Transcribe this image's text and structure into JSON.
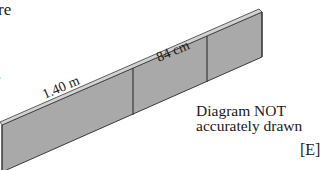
{
  "question_fragment": {
    "cropped_text_top": "re",
    "cropped_text_left": "."
  },
  "diagram": {
    "type": "wall-isometric",
    "panels": 3,
    "labels": {
      "length_label": "1.40 m",
      "height_label": "84 cm"
    },
    "colors": {
      "front_face": "#a9a9a9",
      "top_face": "#cfcfcf",
      "edge": "#3a3a3a"
    }
  },
  "note": {
    "line1": "Diagram NOT",
    "line2": "accurately drawn"
  },
  "mark": "[E]"
}
